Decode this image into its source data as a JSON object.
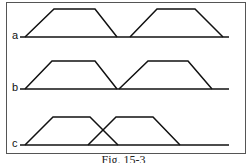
{
  "figure": {
    "caption": "Fig. 15-3",
    "rows": [
      {
        "label": "a",
        "description": "Two trapezoids, separated by a gap",
        "baseline_y": 37,
        "top_y": 9,
        "baseline_x": [
          20,
          229
        ],
        "trapezoids": [
          [
            25,
            54,
            95,
            117
          ],
          [
            130,
            157,
            195,
            223
          ]
        ]
      },
      {
        "label": "b",
        "description": "Two trapezoids touching at the base",
        "baseline_y": 89,
        "top_y": 61,
        "baseline_x": [
          20,
          229
        ],
        "trapezoids": [
          [
            25,
            52,
            95,
            117
          ],
          [
            119,
            148,
            188,
            212
          ]
        ]
      },
      {
        "label": "c",
        "description": "Two trapezoids overlapping",
        "baseline_y": 145,
        "top_y": 117,
        "baseline_x": [
          20,
          229
        ],
        "trapezoids": [
          [
            25,
            53,
            90,
            118
          ],
          [
            88,
            116,
            153,
            180
          ]
        ]
      }
    ],
    "colors": {
      "line": "#111111",
      "frame": "#555555",
      "background": "#ffffff"
    }
  }
}
